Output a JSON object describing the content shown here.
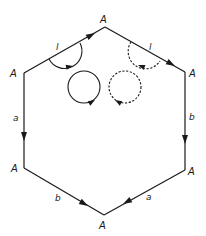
{
  "diagram": {
    "vertices": [
      {
        "id": "top",
        "label": "A",
        "x": 105,
        "y": 27
      },
      {
        "id": "upper-right",
        "label": "A",
        "x": 185,
        "y": 72
      },
      {
        "id": "lower-right",
        "label": "A",
        "x": 185,
        "y": 170
      },
      {
        "id": "bottom",
        "label": "A",
        "x": 104,
        "y": 215
      },
      {
        "id": "lower-left",
        "label": "A",
        "x": 24,
        "y": 168
      },
      {
        "id": "upper-left",
        "label": "A",
        "x": 24,
        "y": 73
      }
    ],
    "edges": [
      {
        "id": "upper-left-edge",
        "from": "upper-left",
        "to": "top",
        "label": "l",
        "direction": "toward top"
      },
      {
        "id": "upper-right-edge",
        "from": "top",
        "to": "upper-right",
        "label": "l",
        "direction": "toward upper-right"
      },
      {
        "id": "right-edge",
        "from": "upper-right",
        "to": "lower-right",
        "label": "b",
        "direction": "down"
      },
      {
        "id": "lower-right-edge",
        "from": "lower-right",
        "to": "bottom",
        "label": "a",
        "direction": "toward bottom"
      },
      {
        "id": "lower-left-edge",
        "from": "lower-left",
        "to": "bottom",
        "label": "b",
        "direction": "toward bottom"
      },
      {
        "id": "left-edge",
        "from": "upper-left",
        "to": "lower-left",
        "label": "a",
        "direction": "down"
      }
    ],
    "loops": [
      {
        "id": "solid-arc",
        "style": "solid",
        "location": "around upper-left edge"
      },
      {
        "id": "dashed-arc",
        "style": "dashed",
        "location": "around upper-right edge"
      },
      {
        "id": "solid-circle",
        "style": "solid",
        "orientation": "clockwise"
      },
      {
        "id": "dashed-circle",
        "style": "dashed",
        "orientation": "counterclockwise"
      }
    ]
  },
  "labels": {
    "vertex_top": "A",
    "vertex_upper_right": "A",
    "vertex_lower_right": "A",
    "vertex_bottom": "A",
    "vertex_lower_left": "A",
    "vertex_upper_left": "A",
    "edge_upper_left": "l",
    "edge_upper_right": "l",
    "edge_right": "b",
    "edge_lower_right": "a",
    "edge_lower_left": "b",
    "edge_left": "a"
  },
  "colors": {
    "stroke": "#1a1a1a",
    "background": "#ffffff"
  }
}
